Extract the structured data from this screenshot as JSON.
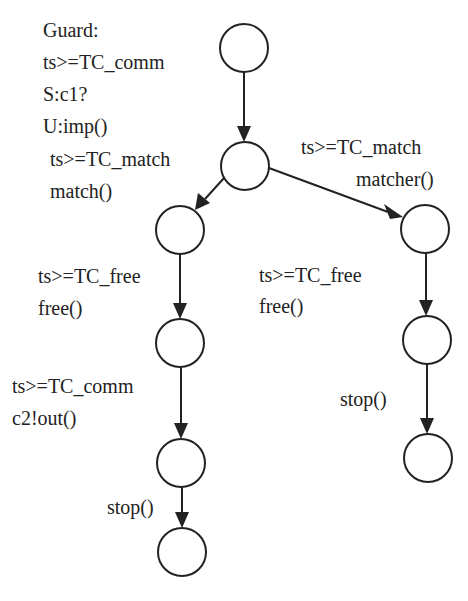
{
  "diagram": {
    "type": "state-machine",
    "nodes": [
      {
        "id": "s0",
        "cx": 244,
        "cy": 48
      },
      {
        "id": "s1",
        "cx": 245,
        "cy": 166
      },
      {
        "id": "s2",
        "cx": 180,
        "cy": 230
      },
      {
        "id": "s3",
        "cx": 425,
        "cy": 229
      },
      {
        "id": "s4",
        "cx": 180,
        "cy": 343
      },
      {
        "id": "s5",
        "cx": 427,
        "cy": 340
      },
      {
        "id": "s6",
        "cx": 181,
        "cy": 463
      },
      {
        "id": "s7",
        "cx": 428,
        "cy": 458
      },
      {
        "id": "s8",
        "cx": 182,
        "cy": 552
      }
    ],
    "labels": {
      "guard_title": "Guard:",
      "e0_line1": "ts>=TC_comm",
      "e0_line2": "S:c1?",
      "e0_line3": "U:imp()",
      "e1_line1": "ts>=TC_match",
      "e1_line2": "match()",
      "e2_line1": "ts>=TC_match",
      "e2_line2": "matcher()",
      "e3_line1": "ts>=TC_free",
      "e3_line2": "free()",
      "e4_line1": "ts>=TC_free",
      "e4_line2": "free()",
      "e5_line1": "ts>=TC_comm",
      "e5_line2": "c2!out()",
      "e6_line1": "stop()",
      "e7_line1": "stop()"
    },
    "edges": [
      {
        "from": "s0",
        "to": "s1",
        "label": "Guard: ts>=TC_comm S:c1? U:imp()"
      },
      {
        "from": "s1",
        "to": "s2",
        "label": "ts>=TC_match match()"
      },
      {
        "from": "s1",
        "to": "s3",
        "label": "ts>=TC_match matcher()"
      },
      {
        "from": "s2",
        "to": "s4",
        "label": "ts>=TC_free free()"
      },
      {
        "from": "s3",
        "to": "s5",
        "label": "ts>=TC_free free()"
      },
      {
        "from": "s4",
        "to": "s6",
        "label": "ts>=TC_comm c2!out()"
      },
      {
        "from": "s5",
        "to": "s7",
        "label": "stop()"
      },
      {
        "from": "s6",
        "to": "s8",
        "label": "stop()"
      }
    ]
  }
}
